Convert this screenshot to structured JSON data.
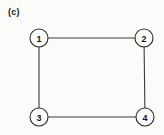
{
  "figure": {
    "panel_label": "(c)",
    "width": 164,
    "height": 135,
    "background_color": "#fbfbfa",
    "stroke_color": "#3c3c3c",
    "node_stroke_color": "#2b2b2b",
    "node_fill_color": "#fdfdfc",
    "label_color": "#141414"
  },
  "chart_data": {
    "type": "diagram",
    "diagram_type": "undirected-graph",
    "title": "(c)",
    "nodes": [
      {
        "id": "1",
        "label": "1",
        "x": 39,
        "y": 38,
        "r": 9
      },
      {
        "id": "2",
        "label": "2",
        "x": 144,
        "y": 38,
        "r": 9
      },
      {
        "id": "3",
        "label": "3",
        "x": 39,
        "y": 117,
        "r": 9
      },
      {
        "id": "4",
        "label": "4",
        "x": 145,
        "y": 117,
        "r": 9
      }
    ],
    "edges": [
      {
        "source": "1",
        "target": "2",
        "name": "edge-1-2"
      },
      {
        "source": "1",
        "target": "3",
        "name": "edge-1-3"
      },
      {
        "source": "3",
        "target": "4",
        "name": "edge-3-4"
      },
      {
        "source": "2",
        "target": "4",
        "name": "edge-2-4"
      }
    ],
    "node_count": 4,
    "edge_count": 4,
    "degree_sequence": [
      2,
      2,
      2,
      2
    ],
    "shape": "square cycle C4",
    "directed": false,
    "weighted": false,
    "legend": [],
    "annotations": []
  }
}
